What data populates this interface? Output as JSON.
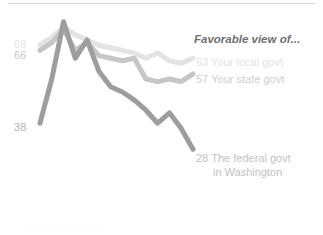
{
  "legend": {
    "title": "Favorable view of..."
  },
  "start_labels": {
    "local": "68",
    "state": "66",
    "federal": "38"
  },
  "end_labels": {
    "local_value": "63",
    "local_name": "Your local govt",
    "state_value": "57",
    "state_name": "Your state govt",
    "federal_value": "28",
    "federal_name": "The federal govt",
    "federal_name_line2": "in Washington"
  },
  "footer": {
    "note": "Survey conducted April 5-11, 2018."
  },
  "colors": {
    "local": "#e3e3e3",
    "state": "#c6c6c6",
    "federal": "#9d9d9d",
    "background": "#ffffff",
    "rule": "#d8d8d8"
  },
  "chart_data": {
    "type": "line",
    "title": "Favorable view of...",
    "xlabel": "",
    "ylabel": "",
    "ylim": [
      20,
      80
    ],
    "xlim": [
      0,
      13
    ],
    "grid": false,
    "legend_position": "right-endpoint-labels",
    "x": [
      0,
      1,
      2,
      3,
      4,
      5,
      6,
      7,
      8,
      9,
      10,
      11,
      12,
      13
    ],
    "series": [
      {
        "name": "Your local govt",
        "color": "#e3e3e3",
        "start_value": 68,
        "end_value": 63,
        "values": [
          68,
          71,
          75,
          72,
          70,
          68,
          67,
          66,
          65,
          63,
          65,
          62,
          61,
          63
        ]
      },
      {
        "name": "Your state govt",
        "color": "#c6c6c6",
        "start_value": 66,
        "end_value": 57,
        "values": [
          66,
          69,
          74,
          66,
          69,
          64,
          63,
          62,
          63,
          55,
          54,
          55,
          54,
          57
        ]
      },
      {
        "name": "The federal govt in Washington",
        "color": "#9d9d9d",
        "start_value": 38,
        "end_value": 28,
        "values": [
          38,
          55,
          77,
          63,
          70,
          58,
          52,
          50,
          47,
          43,
          38,
          42,
          36,
          28
        ]
      }
    ],
    "annotations": [
      {
        "text": "68",
        "series": "Your local govt",
        "position": "start"
      },
      {
        "text": "66",
        "series": "Your state govt",
        "position": "start"
      },
      {
        "text": "38",
        "series": "The federal govt in Washington",
        "position": "start"
      },
      {
        "text": "63",
        "series": "Your local govt",
        "position": "end"
      },
      {
        "text": "57",
        "series": "Your state govt",
        "position": "end"
      },
      {
        "text": "28",
        "series": "The federal govt in Washington",
        "position": "end"
      }
    ]
  }
}
